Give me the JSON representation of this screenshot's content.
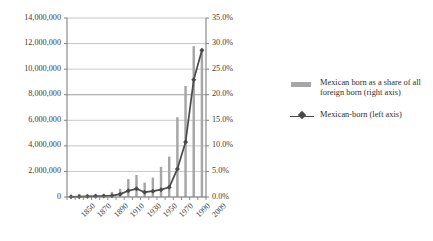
{
  "chart_data": {
    "type": "bar",
    "title": "",
    "subtitle": "",
    "xlabel": "",
    "ylabel": "",
    "grid": true,
    "legend_position": "right",
    "categories": [
      "1850",
      "1860",
      "1870",
      "1880",
      "1890",
      "1900",
      "1910",
      "1920",
      "1930",
      "1940",
      "1950",
      "1960",
      "1970",
      "1980",
      "1990",
      "2000",
      "2009"
    ],
    "x_tick_labels": [
      "1850",
      "1870",
      "1890",
      "1910",
      "1930",
      "1950",
      "1970",
      "1990",
      "2009"
    ],
    "left_axis": {
      "label": "Mexican-born (left axis)",
      "ticks": [
        "0",
        "2,000,000",
        "4,000,000",
        "6,000,000",
        "8,000,000",
        "10,000,000",
        "12,000,000",
        "14,000,000"
      ],
      "tick_values": [
        0,
        2000000,
        4000000,
        6000000,
        8000000,
        10000000,
        12000000,
        14000000
      ],
      "ylim": [
        0,
        14000000
      ]
    },
    "right_axis": {
      "label": "Mexican born as a share of all foreign born (right axis)",
      "ticks": [
        "0.0%",
        "5.0%",
        "10.0%",
        "15.0%",
        "20.0%",
        "25.0%",
        "30.0%",
        "35.0%"
      ],
      "tick_values": [
        0,
        5,
        10,
        15,
        20,
        25,
        30,
        35
      ],
      "ylim": [
        0,
        35
      ]
    },
    "series": [
      {
        "name": "Mexican born as a share of all foreign born (right axis)",
        "type": "bar",
        "axis": "right",
        "color": "#a6a6a6",
        "unit": "%",
        "values": [
          0.2,
          0.6,
          0.5,
          0.6,
          0.6,
          1.0,
          1.6,
          3.5,
          4.3,
          2.8,
          3.8,
          5.9,
          7.9,
          15.6,
          21.7,
          29.5,
          29.0
        ]
      },
      {
        "name": "Mexican-born (left axis)",
        "type": "line",
        "axis": "left",
        "color": "#4a4a4a",
        "marker": "diamond",
        "values": [
          13300,
          27500,
          42400,
          68400,
          77900,
          103400,
          221900,
          486400,
          641500,
          377400,
          454000,
          575900,
          759700,
          2199200,
          4298000,
          9177000,
          11478000
        ]
      }
    ]
  },
  "legend": {
    "items": [
      {
        "marker": "bar-swatch",
        "label": "Mexican born as a share of all foreign born (right axis)"
      },
      {
        "marker": "line-diamond",
        "label": "Mexican-born (left axis)"
      }
    ]
  },
  "colors": {
    "bar": "#a6a6a6",
    "line": "#4a4a4a",
    "grid": "#b7b7b7",
    "axis": "#808080",
    "text": "#3a3a3a"
  }
}
